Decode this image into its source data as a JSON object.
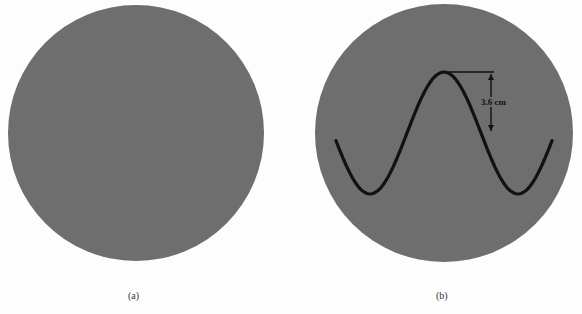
{
  "figure": {
    "panels": [
      {
        "id": "a",
        "label": "(a)",
        "center": [
          136,
          133
        ],
        "radius": 128,
        "trace": "none"
      },
      {
        "id": "b",
        "label": "(b)",
        "center": [
          444,
          133
        ],
        "radius": 129,
        "trace": "sine",
        "annotation": "3.6 cm"
      }
    ],
    "colors": {
      "screen": "#6e6e6e",
      "grid": "#f2f2f2",
      "trace": "#111111",
      "background": "#fdfdfd"
    },
    "grid_spacing_px": 17
  }
}
